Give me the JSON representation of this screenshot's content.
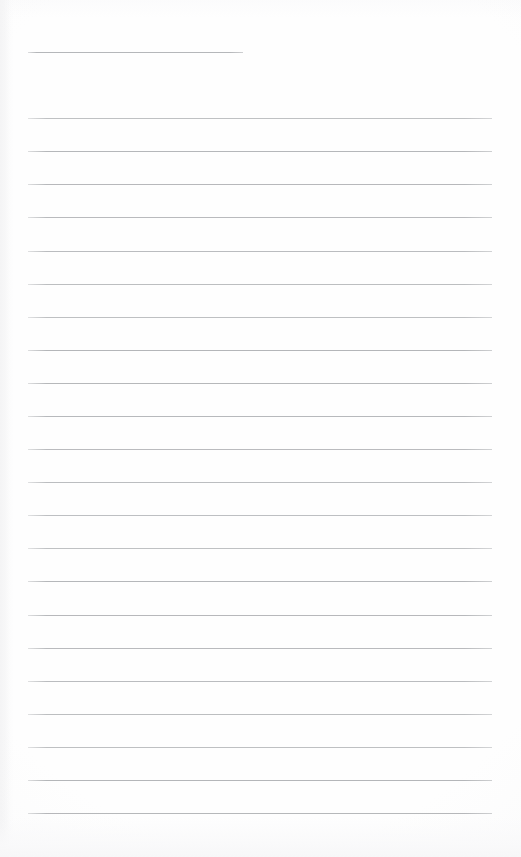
{
  "document": {
    "type": "blank-ruled-notepaper-scan",
    "page_width": 521,
    "page_height": 857,
    "background_color": "#fefefe",
    "rule_color": "#b2b4b7",
    "rule_thickness": 1,
    "text_content": "",
    "header_line": {
      "name": "title-rule",
      "x_start": 28,
      "x_end": 243,
      "y": 52,
      "length": 215
    },
    "body_lines": {
      "count": 22,
      "x_start": 28,
      "x_end": 492,
      "length": 464,
      "first_y": 118,
      "spacing": 33.1,
      "y_positions": [
        118,
        151,
        184,
        217,
        251,
        284,
        317,
        350,
        383,
        416,
        449,
        482,
        515,
        548,
        581,
        615,
        648,
        681,
        714,
        747,
        780,
        813
      ]
    },
    "margins": {
      "left": 28,
      "right": 29,
      "top": 52,
      "bottom": 44
    },
    "artifacts": {
      "bottom_band": "faint-scanner-smudge",
      "left_edge": "faint-scan-shadow"
    }
  }
}
